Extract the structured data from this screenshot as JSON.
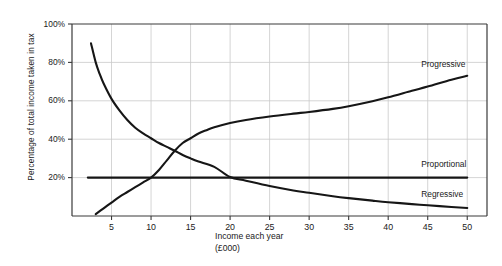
{
  "chart_data": {
    "type": "line",
    "title": "",
    "xlabel": "Income each year",
    "xlabel_units": "(£000)",
    "ylabel": "Percentage of total income taken in tax",
    "xlim": [
      0,
      52.5
    ],
    "ylim": [
      0,
      100
    ],
    "grid": true,
    "legend_position": "inline-right",
    "x_ticks": [
      5,
      10,
      15,
      20,
      25,
      30,
      35,
      40,
      45,
      50
    ],
    "x_tick_labels": [
      "5",
      "10",
      "15",
      "20",
      "25",
      "30",
      "35",
      "40",
      "45",
      "50"
    ],
    "y_ticks": [
      20,
      40,
      60,
      80,
      100
    ],
    "y_tick_labels": [
      "20%",
      "40%",
      "60%",
      "80%",
      "100%"
    ],
    "line_color": "#161616",
    "grid_color": "#c9c9c9",
    "axis_color": "#3a3a3a",
    "series": [
      {
        "name": "Progressive",
        "label": "Progressive",
        "label_x": 50,
        "label_y": 79,
        "x": [
          3,
          4,
          5,
          6,
          7,
          8,
          9,
          10,
          11,
          12,
          13,
          14,
          15,
          16,
          17,
          18,
          20,
          22,
          25,
          28,
          30,
          33,
          35,
          38,
          40,
          43,
          45,
          48,
          50
        ],
        "y": [
          1,
          4,
          7,
          10,
          12.5,
          15,
          17.5,
          20,
          24,
          29,
          34,
          38,
          40.5,
          43,
          44.7,
          46.2,
          48.4,
          50,
          51.8,
          53.3,
          54.2,
          55.8,
          57.2,
          59.8,
          61.8,
          65.2,
          67.4,
          71,
          73
        ]
      },
      {
        "name": "Proportional",
        "label": "Proportional",
        "label_x": 50,
        "label_y": 27,
        "x": [
          2,
          10,
          20,
          30,
          40,
          50
        ],
        "y": [
          20,
          20,
          20,
          20,
          20,
          20
        ]
      },
      {
        "name": "Regressive",
        "label": "Regressive",
        "label_x": 50,
        "label_y": 11,
        "x": [
          2.4,
          3,
          3.5,
          4,
          5,
          6,
          7,
          8,
          9,
          10,
          11,
          12,
          13,
          14,
          15,
          16,
          18,
          20,
          22,
          25,
          28,
          30,
          33,
          35,
          38,
          40,
          43,
          45,
          48,
          50
        ],
        "y": [
          90,
          80,
          74,
          69,
          61,
          55,
          50,
          46,
          43,
          40.5,
          38,
          36,
          34,
          31.8,
          30,
          28.4,
          25.6,
          20.3,
          18.4,
          15.6,
          13.3,
          12.1,
          10.3,
          9.3,
          8,
          7.2,
          6.2,
          5.6,
          4.7,
          4.2
        ]
      }
    ]
  },
  "axes_geometry": {
    "plot_left": 72,
    "plot_right": 487,
    "plot_top": 24,
    "plot_bottom": 216
  }
}
